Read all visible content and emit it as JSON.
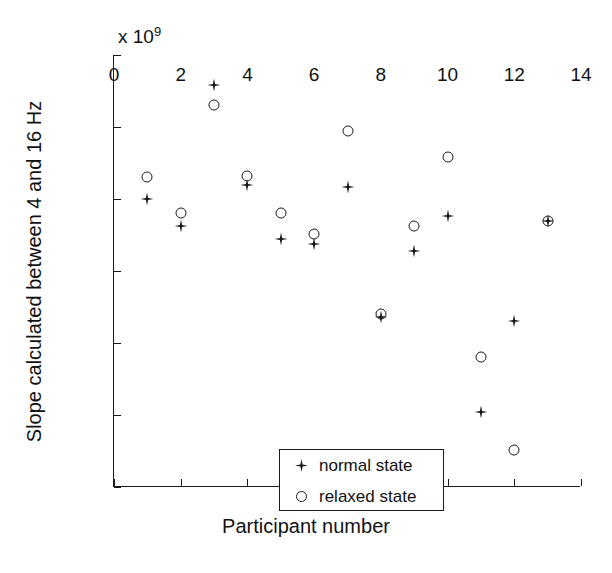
{
  "chart_data": {
    "type": "scatter",
    "title": "",
    "xlabel": "Participant number",
    "ylabel": "Slope calculated between 4 and 16 Hz",
    "y_exponent_label": "x 10",
    "y_exponent_power": "9",
    "y_scale": 1000000000.0,
    "xlim": [
      0,
      14
    ],
    "ylim": [
      -2,
      1
    ],
    "xticks": [
      0,
      2,
      4,
      6,
      8,
      10,
      12,
      14
    ],
    "xtick_labels": [
      "0",
      "2",
      "4",
      "6",
      "8",
      "10",
      "12",
      "14"
    ],
    "yticks": [
      1,
      0.5,
      0,
      -0.5,
      -1,
      -1.5,
      -2
    ],
    "ytick_labels": [
      "1",
      "0.5",
      "0",
      "−0.5",
      "−1",
      "−1.5",
      "−2"
    ],
    "grid": false,
    "legend_position": "lower-left-inside",
    "x": [
      1,
      2,
      3,
      4,
      5,
      6,
      7,
      8,
      9,
      10,
      11,
      12,
      13
    ],
    "series": [
      {
        "name": "normal state",
        "marker": "star",
        "color": "#1a1a1a",
        "values": [
          0.0,
          -0.19,
          0.79,
          0.1,
          -0.28,
          -0.31,
          0.08,
          -0.82,
          -0.36,
          -0.12,
          -1.48,
          -0.85,
          -0.15
        ]
      },
      {
        "name": "relaxed state",
        "marker": "circle",
        "color": "#1a1a1a",
        "values": [
          0.15,
          -0.1,
          0.65,
          0.16,
          -0.1,
          -0.24,
          0.47,
          -0.8,
          -0.19,
          0.29,
          -1.1,
          -1.74,
          -0.15
        ]
      }
    ]
  },
  "legend": {
    "items": [
      {
        "symbol": "star-marker-icon",
        "label": "normal state"
      },
      {
        "symbol": "circle-marker-icon",
        "label": "relaxed state"
      }
    ]
  }
}
